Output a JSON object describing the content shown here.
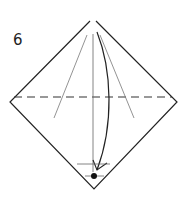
{
  "diagram": {
    "step_number": "6",
    "colors": {
      "line": "#222222",
      "guide": "#888888",
      "background": "#ffffff"
    }
  }
}
